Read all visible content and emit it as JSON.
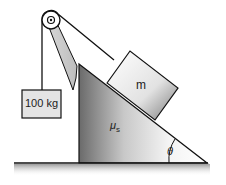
{
  "diagram": {
    "type": "physics-incline-pulley",
    "hanging_mass_label": "100 kg",
    "block_label": "m",
    "friction_label": "μ",
    "friction_subscript": "s",
    "angle_label": "θ",
    "colors": {
      "outline": "#111111",
      "box_fill": "#e6e6e6",
      "incline_dark": "#6e6e6e",
      "incline_light": "#ffffff"
    }
  }
}
